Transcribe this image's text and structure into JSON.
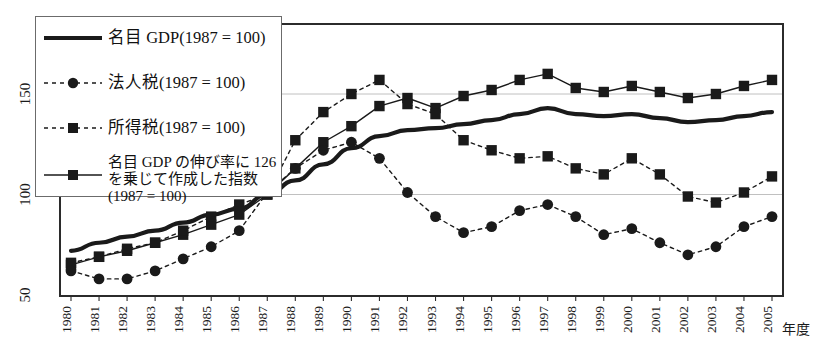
{
  "figure": {
    "title_partial": "",
    "xaxis_name": "年度",
    "background": "#ffffff",
    "line_color": "#1a1a1a",
    "grid_color": "#b9b9b9",
    "frame_color": "#2b2b2b"
  },
  "legend": {
    "items": [
      {
        "label": "名目 GDP(1987 = 100)",
        "style": "solid-thick",
        "marker": "none",
        "name": "legend-nominal-gdp"
      },
      {
        "label": "法人税(1987 = 100)",
        "style": "dashed",
        "marker": "circle",
        "name": "legend-corporate-tax"
      },
      {
        "label": "所得税(1987 = 100)",
        "style": "dashed",
        "marker": "square",
        "name": "legend-income-tax"
      },
      {
        "label": "名目 GDP の伸び率に 126 を乗じて作成した指数 (1987 = 100)",
        "style": "solid-thin",
        "marker": "square",
        "name": "legend-gdp-index-126"
      }
    ]
  },
  "chart_data": {
    "type": "line",
    "title": "",
    "xlabel": "年度",
    "ylabel": "",
    "xlim": [
      1980,
      2005
    ],
    "ylim": [
      50,
      170
    ],
    "yticks": [
      50,
      100,
      150
    ],
    "ytick_labels": [
      "50",
      "100",
      "150"
    ],
    "grid": true,
    "legend_position": "upper-left-inside",
    "x": [
      1980,
      1981,
      1982,
      1983,
      1984,
      1985,
      1986,
      1987,
      1988,
      1989,
      1990,
      1991,
      1992,
      1993,
      1994,
      1995,
      1996,
      1997,
      1998,
      1999,
      2000,
      2001,
      2002,
      2003,
      2004,
      2005
    ],
    "xtick_labels": [
      "1980",
      "1981",
      "1982",
      "1983",
      "1984",
      "1985",
      "1986",
      "1987",
      "1988",
      "1989",
      "1990",
      "1991",
      "1992",
      "1993",
      "1994",
      "1995",
      "1996",
      "1997",
      "1998",
      "1999",
      "2000",
      "2001",
      "2002",
      "2003",
      "2004",
      "2005"
    ],
    "series": [
      {
        "name": "名目 GDP(1987 = 100)",
        "style": "solid-thick",
        "marker": "none",
        "values": [
          72,
          76,
          79,
          82,
          86,
          90,
          93,
          100,
          107,
          115,
          123,
          129,
          132,
          133,
          135,
          137,
          140,
          143,
          140,
          139,
          140,
          138,
          136,
          137,
          139,
          141
        ]
      },
      {
        "name": "法人税(1987 = 100)",
        "style": "dashed",
        "marker": "circle",
        "values": [
          62,
          58,
          58,
          62,
          68,
          74,
          82,
          101,
          113,
          122,
          126,
          118,
          101,
          89,
          81,
          84,
          92,
          95,
          89,
          80,
          83,
          76,
          70,
          74,
          84,
          89
        ]
      },
      {
        "name": "所得税(1987 = 100)",
        "style": "dashed",
        "marker": "square",
        "values": [
          66,
          69,
          73,
          76,
          82,
          89,
          95,
          100,
          127,
          141,
          150,
          157,
          145,
          140,
          127,
          122,
          118,
          119,
          113,
          110,
          118,
          110,
          99,
          96,
          101,
          109
        ]
      },
      {
        "name": "名目 GDP の伸び率に 126 を乗じて作成した指数(1987 = 100)",
        "style": "solid-thin",
        "marker": "square",
        "values": [
          65,
          69,
          72,
          76,
          80,
          85,
          90,
          100,
          113,
          126,
          134,
          144,
          148,
          143,
          149,
          152,
          157,
          160,
          153,
          151,
          154,
          151,
          148,
          150,
          154,
          157
        ]
      }
    ]
  }
}
